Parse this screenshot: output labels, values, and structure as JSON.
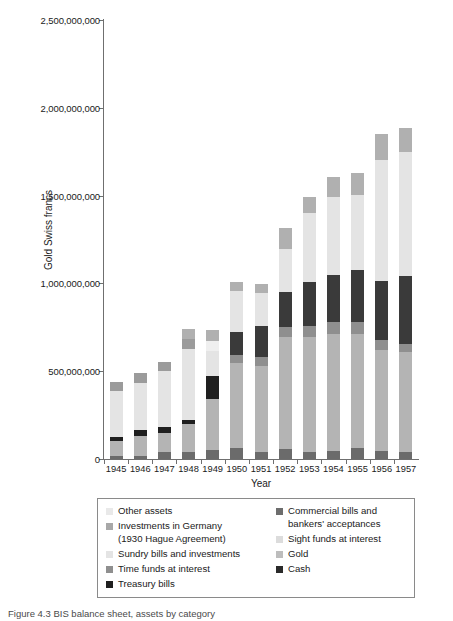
{
  "chart_data": {
    "type": "bar",
    "stacked": true,
    "title": "",
    "xlabel": "Year",
    "ylabel": "Gold Swiss francs",
    "ylim": [
      0,
      2500000000
    ],
    "yticks": [
      0,
      500000000,
      1000000000,
      1500000000,
      2000000000,
      2500000000
    ],
    "ytick_labels": [
      "0",
      "500,000,000",
      "1,000,000,000",
      "1,500,000,000",
      "2,000,000,000",
      "2,500,000,000"
    ],
    "grid": false,
    "legend_position": "below-plot",
    "categories": [
      "1945",
      "1946",
      "1947",
      "1948",
      "1949",
      "1950",
      "1951",
      "1952",
      "1953",
      "1954",
      "1955",
      "1956",
      "1957"
    ],
    "series": [
      {
        "name": "Cash",
        "color": "#6b6b6b",
        "values": [
          20000000,
          20000000,
          40000000,
          40000000,
          50000000,
          65000000,
          40000000,
          55000000,
          40000000,
          45000000,
          60000000,
          45000000,
          40000000
        ]
      },
      {
        "name": "Gold",
        "color": "#b4b4b4",
        "values": [
          80000000,
          110000000,
          110000000,
          160000000,
          290000000,
          480000000,
          490000000,
          640000000,
          655000000,
          665000000,
          650000000,
          575000000,
          570000000
        ]
      },
      {
        "name": "Treasury bills",
        "color": "#1f1f1f",
        "values": [
          25000000,
          35000000,
          30000000,
          25000000,
          135000000,
          0,
          0,
          0,
          0,
          0,
          0,
          0,
          0
        ]
      },
      {
        "name": "Time funds at interest",
        "color": "#8f8f8f",
        "values": [
          0,
          0,
          0,
          0,
          0,
          50000000,
          50000000,
          55000000,
          60000000,
          70000000,
          70000000,
          55000000,
          45000000
        ]
      },
      {
        "name": "Commercial bills and bankers' acceptances",
        "color": "#3a3a3a",
        "values": [
          0,
          0,
          0,
          0,
          0,
          130000000,
          175000000,
          200000000,
          255000000,
          270000000,
          295000000,
          340000000,
          390000000
        ]
      },
      {
        "name": "Sundry bills and investments",
        "color": "#e4e4e4",
        "values": [
          260000000,
          270000000,
          320000000,
          400000000,
          140000000,
          230000000,
          190000000,
          245000000,
          390000000,
          445000000,
          430000000,
          690000000,
          705000000
        ]
      },
      {
        "name": "Investments in Germany (1930 Hague Agreement)",
        "color": "#9b9b9b",
        "values": [
          55000000,
          55000000,
          50000000,
          60000000,
          0,
          0,
          0,
          0,
          0,
          0,
          0,
          0,
          0
        ]
      },
      {
        "name": "Sight funds at interest",
        "color": "#efefef",
        "values": [
          0,
          0,
          0,
          0,
          60000000,
          0,
          0,
          0,
          0,
          0,
          0,
          0,
          0
        ]
      },
      {
        "name": "Other assets",
        "color": "#b0b0b0",
        "values": [
          0,
          0,
          0,
          55000000,
          60000000,
          55000000,
          50000000,
          120000000,
          90000000,
          110000000,
          125000000,
          145000000,
          135000000
        ]
      }
    ],
    "totals": [
      440000000,
      490000000,
      550000000,
      740000000,
      735000000,
      1010000000,
      995000000,
      1315000000,
      1490000000,
      1605000000,
      1630000000,
      1850000000,
      1885000000
    ]
  },
  "axes": {
    "y_title": "Gold Swiss francs",
    "x_title": "Year",
    "y_tick_labels": [
      "2,500,000,000",
      "2,000,000,000",
      "1,500,000,000",
      "1,000,000,000",
      "500,000,000",
      "0"
    ],
    "x_tick_labels": [
      "1945",
      "1946",
      "1947",
      "1948",
      "1949",
      "1950",
      "1951",
      "1952",
      "1953",
      "1954",
      "1955",
      "1956",
      "1957"
    ]
  },
  "legend": {
    "left_column": [
      {
        "label": "Other assets",
        "color": "#e9e9e9"
      },
      {
        "label": "Investments in Germany",
        "label_line2": "(1930 Hague Agreement)",
        "color": "#a8a8a8"
      },
      {
        "label": "Sundry bills and investments",
        "color": "#e4e4e4"
      },
      {
        "label": "Time funds at interest",
        "color": "#8f8f8f"
      },
      {
        "label": "Treasury bills",
        "color": "#1f1f1f"
      }
    ],
    "right_column": [
      {
        "label": "Commercial bills and",
        "label_line2": "bankers' acceptances",
        "color": "#6d6d6d"
      },
      {
        "label": "Sight funds at interest",
        "color": "#dcdcdc"
      },
      {
        "label": "Gold",
        "color": "#bdbdbd"
      },
      {
        "label": "Cash",
        "color": "#2a2a2a"
      }
    ]
  },
  "caption": {
    "text": "Figure 4.3  BIS balance sheet, assets by category"
  }
}
